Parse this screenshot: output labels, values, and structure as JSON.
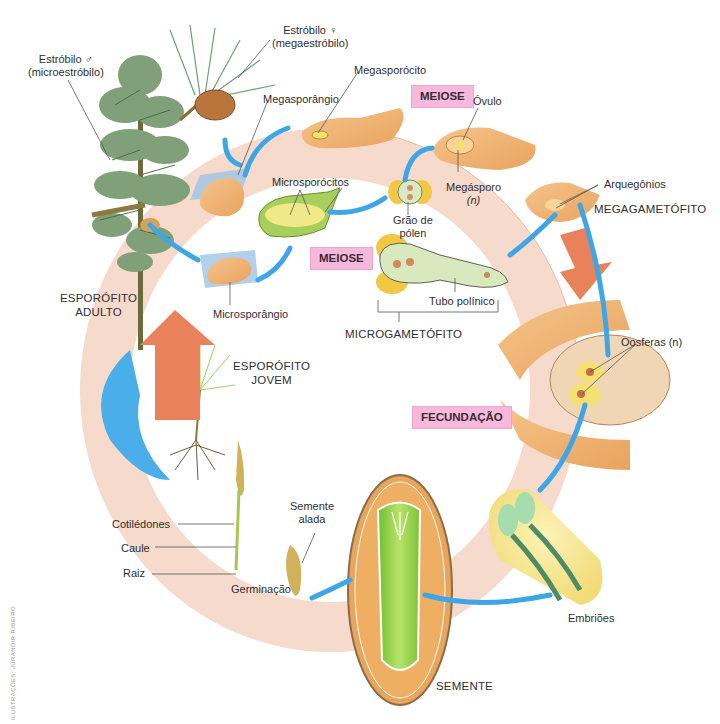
{
  "diagram": {
    "colors": {
      "ring": "#f3c9b3",
      "ring_inner": "#f7ddd0",
      "blue_arrow": "#3ea6e6",
      "orange_arrow": "#e88a5c",
      "tag_pink": "#f6b9dc",
      "ovule_tan": "#f1b778",
      "pollen_yellow": "#f2c744",
      "embryo_green": "#9bd35a",
      "leaf_green": "#6f9a62"
    },
    "labels": {
      "estrobilo_f_1": "Estróbilo ♀",
      "estrobilo_f_2": "(megaestróbilo)",
      "estrobilo_m_1": "Estróbilo ♂",
      "estrobilo_m_2": "(microestróbilo)",
      "megasporangio": "Megasporângio",
      "megasporocito": "Megasporócito",
      "ovulo": "Óvulo",
      "megasporo_1": "Megásporo",
      "megasporo_2": "(n)",
      "microsporocitos": "Microsporócitos",
      "grao_polen_1": "Grão de",
      "grao_polen_2": "pólen",
      "arquegonios": "Arquegônios",
      "megagametofito": "MEGAGAMETÓFITO",
      "microsporangio": "Microsporângio",
      "tubo_polinico": "Tubo polínico",
      "microgametofito": "MICROGAMETÓFITO",
      "esporofito_adulto_1": "ESPORÓFITO",
      "esporofito_adulto_2": "ADULTO",
      "esporofito_jovem_1": "ESPORÓFITO",
      "esporofito_jovem_2": "JOVEM",
      "oosferas": "Oosferas (n)",
      "cotiledones": "Cotilédones",
      "caule": "Caule",
      "raiz": "Raiz",
      "semente_alada_1": "Semente",
      "semente_alada_2": "alada",
      "germinacao": "Germinação",
      "embrioes": "Embriões",
      "semente": "SEMENTE"
    },
    "process_tags": {
      "meiose_top": "MEIOSE",
      "meiose_mid": "MEIOSE",
      "fecundacao": "FECUNDAÇÃO"
    },
    "credit": "ILUSTRAÇÕES: JURANDIR RIBEIRO"
  }
}
